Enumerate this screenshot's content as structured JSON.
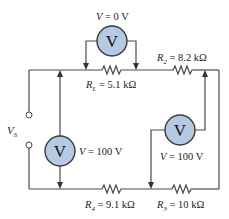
{
  "diagram": {
    "type": "circuit",
    "source": {
      "label": "V",
      "subscript": "S"
    },
    "resistors": [
      {
        "id": "RL",
        "name": "R",
        "sub": "L",
        "value": " = 5.1 kΩ"
      },
      {
        "id": "R2",
        "name": "R",
        "sub": "2",
        "value": " = 8.2 kΩ"
      },
      {
        "id": "R3",
        "name": "R",
        "sub": "3",
        "value": " = 10 kΩ"
      },
      {
        "id": "R4",
        "name": "R",
        "sub": "4",
        "value": " = 9.1 kΩ"
      }
    ],
    "voltmeters": [
      {
        "id": "vm-top",
        "symbol": "V",
        "reading_var": "V",
        "reading": " = 0 V"
      },
      {
        "id": "vm-left",
        "symbol": "V",
        "reading_var": "V",
        "reading": " = 100 V"
      },
      {
        "id": "vm-right",
        "symbol": "V",
        "reading_var": "V",
        "reading": " = 100 V"
      }
    ],
    "colors": {
      "meter_fill": "#b5c9e3",
      "wire": "#4a4a4a"
    }
  }
}
